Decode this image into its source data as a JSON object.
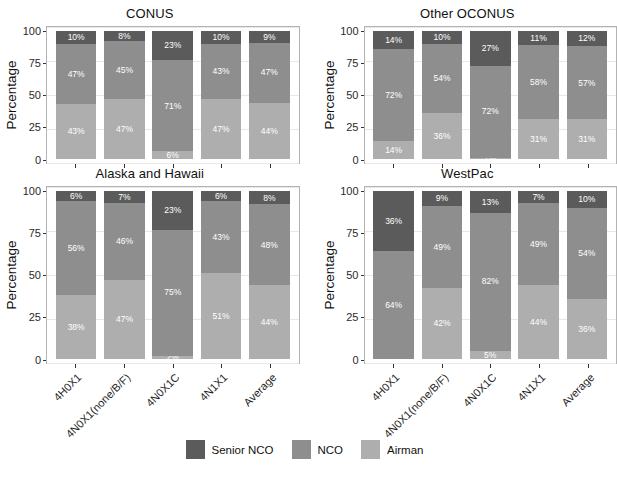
{
  "chart_data": {
    "type": "bar",
    "subtype": "stacked-percent",
    "title": "",
    "xlabel": "",
    "ylabel": "Percentage",
    "ylim": [
      0,
      100
    ],
    "yticks": [
      0,
      25,
      50,
      75,
      100
    ],
    "ytick_labels": [
      "0",
      "25",
      "50",
      "75",
      "100"
    ],
    "grid": true,
    "legend_position": "bottom",
    "categories": [
      "4H0X1",
      "4N0X1(none/B/F)",
      "4N0X1C",
      "4N1X1",
      "Average"
    ],
    "series_names": [
      "Senior NCO",
      "NCO",
      "Airman"
    ],
    "series_colors": [
      "#5b5b5b",
      "#8e8e8e",
      "#aeaeae"
    ],
    "facet_layout": [
      [
        "CONUS",
        "Other OCONUS"
      ],
      [
        "Alaska and Hawaii",
        "WestPac"
      ]
    ],
    "facets": [
      {
        "name": "CONUS",
        "series": [
          {
            "name": "Senior NCO",
            "values": [
              10,
              8,
              23,
              10,
              9
            ]
          },
          {
            "name": "NCO",
            "values": [
              47,
              45,
              71,
              43,
              47
            ]
          },
          {
            "name": "Airman",
            "values": [
              43,
              47,
              6,
              47,
              44
            ]
          }
        ]
      },
      {
        "name": "Other OCONUS",
        "series": [
          {
            "name": "Senior NCO",
            "values": [
              14,
              10,
              27,
              11,
              12
            ]
          },
          {
            "name": "NCO",
            "values": [
              72,
              54,
              72,
              58,
              57
            ]
          },
          {
            "name": "Airman",
            "values": [
              14,
              36,
              1,
              31,
              31
            ]
          }
        ]
      },
      {
        "name": "Alaska and Hawaii",
        "series": [
          {
            "name": "Senior NCO",
            "values": [
              6,
              7,
              23,
              6,
              8
            ]
          },
          {
            "name": "NCO",
            "values": [
              56,
              46,
              75,
              43,
              48
            ]
          },
          {
            "name": "Airman",
            "values": [
              38,
              47,
              2,
              51,
              44
            ]
          }
        ]
      },
      {
        "name": "WestPac",
        "series": [
          {
            "name": "Senior NCO",
            "values": [
              36,
              9,
              13,
              7,
              10
            ]
          },
          {
            "name": "NCO",
            "values": [
              64,
              49,
              82,
              49,
              54
            ]
          },
          {
            "name": "Airman",
            "values": [
              0,
              42,
              5,
              44,
              36
            ]
          }
        ]
      }
    ],
    "bar_labels": {
      "CONUS": [
        [
          "10%",
          "47%",
          "43%"
        ],
        [
          "8%",
          "45%",
          "47%"
        ],
        [
          "23%",
          "71%",
          "6%"
        ],
        [
          "10%",
          "43%",
          "47%"
        ],
        [
          "9%",
          "47%",
          "44%"
        ]
      ],
      "Other OCONUS": [
        [
          "14%",
          "72%",
          "14%"
        ],
        [
          "10%",
          "54%",
          "36%"
        ],
        [
          "27%",
          "72%",
          "1%"
        ],
        [
          "11%",
          "58%",
          "31%"
        ],
        [
          "12%",
          "57%",
          "31%"
        ]
      ],
      "Alaska and Hawaii": [
        [
          "6%",
          "56%",
          "38%"
        ],
        [
          "7%",
          "46%",
          "47%"
        ],
        [
          "23%",
          "75%",
          "2%"
        ],
        [
          "6%",
          "43%",
          "51%"
        ],
        [
          "8%",
          "48%",
          "44%"
        ]
      ],
      "WestPac": [
        [
          "36%",
          "64%",
          ""
        ],
        [
          "9%",
          "49%",
          "42%"
        ],
        [
          "13%",
          "82%",
          "5%"
        ],
        [
          "7%",
          "49%",
          "44%"
        ],
        [
          "10%",
          "54%",
          "36%"
        ]
      ]
    }
  },
  "legend": {
    "items": [
      {
        "label": "Senior NCO",
        "color": "#5b5b5b"
      },
      {
        "label": "NCO",
        "color": "#8e8e8e"
      },
      {
        "label": "Airman",
        "color": "#aeaeae"
      }
    ]
  }
}
